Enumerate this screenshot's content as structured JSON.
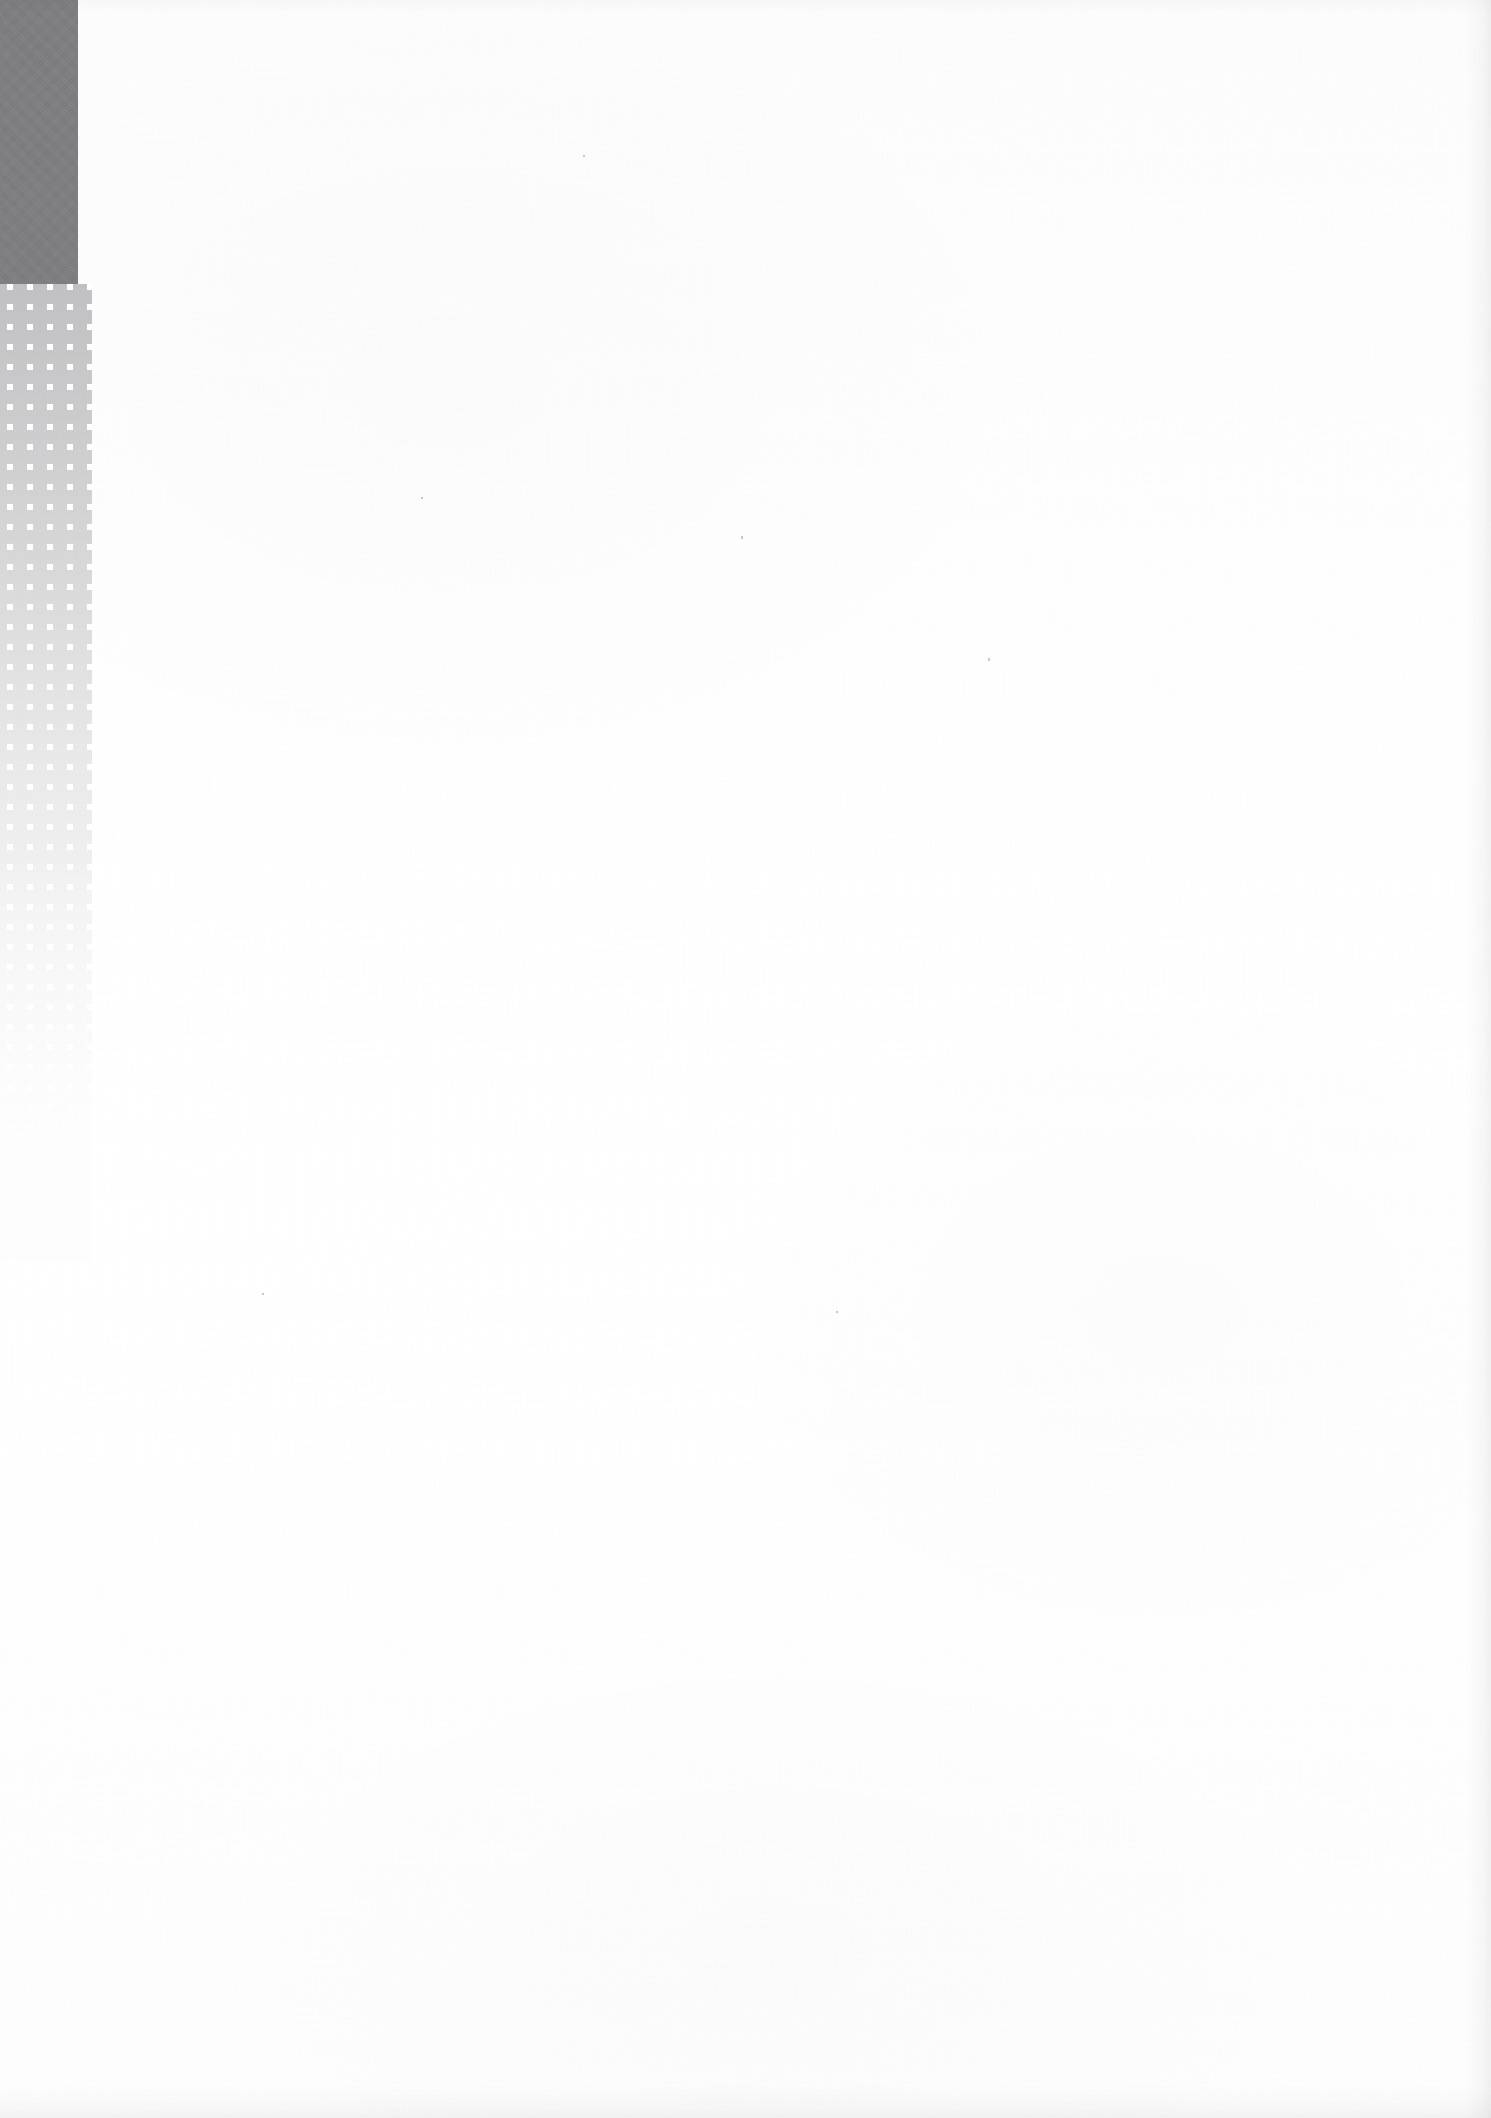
{
  "page": {
    "kind": "scanned-blank-page",
    "width": 1491,
    "height": 2118,
    "paper_color": "#fdfdfd",
    "visible_text": "",
    "body_text": "",
    "header_text": "",
    "footer_text": "",
    "page_number": ""
  },
  "decoration": {
    "name": "margin-motif",
    "description": "dark grey slab over a fading white-square halftone band in the left margin",
    "slab": {
      "color": "#7e7e81",
      "x": 0,
      "y": 0,
      "width": 78,
      "height": 284
    },
    "dot_band": {
      "band_color": "#96969b",
      "dot_color": "#ffffff",
      "x": 0,
      "y": 284,
      "width": 92,
      "height": 978,
      "dot_size": 6,
      "dot_pitch": 20,
      "columns": 4,
      "fade_direction": "top-to-bottom"
    }
  },
  "artifacts": {
    "specks": [
      {
        "x": 583,
        "y": 155,
        "w": 2,
        "h": 2
      },
      {
        "x": 741,
        "y": 536,
        "w": 2,
        "h": 3
      },
      {
        "x": 421,
        "y": 497,
        "w": 2,
        "h": 2
      },
      {
        "x": 988,
        "y": 658,
        "w": 2,
        "h": 3
      },
      {
        "x": 836,
        "y": 1311,
        "w": 2,
        "h": 2
      },
      {
        "x": 262,
        "y": 1293,
        "w": 2,
        "h": 2
      }
    ]
  }
}
